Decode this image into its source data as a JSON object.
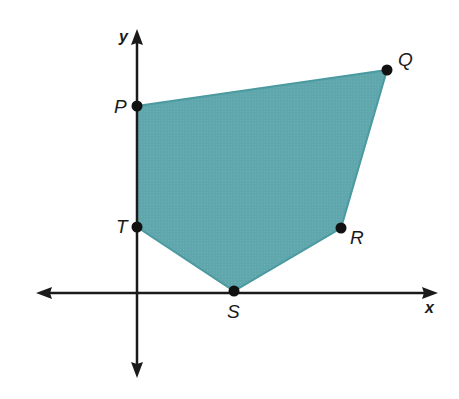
{
  "diagram": {
    "type": "coordinate-plane-polygon",
    "axes": {
      "x_label": "x",
      "y_label": "y"
    },
    "polygon": {
      "name": "PQRST",
      "fill": "#5fa7ac",
      "stroke": "#4a9aa0",
      "vertices": [
        {
          "label": "P",
          "px": [
            137,
            106
          ]
        },
        {
          "label": "Q",
          "px": [
            387,
            70
          ]
        },
        {
          "label": "R",
          "px": [
            341,
            228
          ]
        },
        {
          "label": "S",
          "px": [
            234,
            291
          ]
        },
        {
          "label": "T",
          "px": [
            137,
            227
          ]
        }
      ]
    },
    "origin_px": [
      137,
      293
    ]
  },
  "labels": {
    "P": "P",
    "Q": "Q",
    "R": "R",
    "S": "S",
    "T": "T",
    "x": "x",
    "y": "y"
  }
}
